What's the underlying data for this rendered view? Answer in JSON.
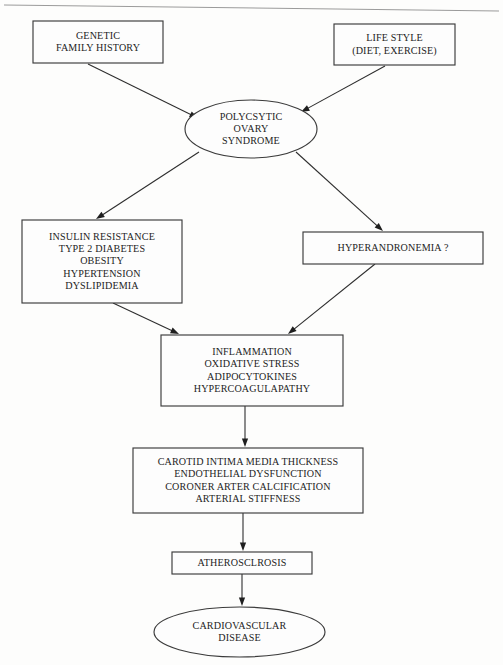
{
  "diagram": {
    "orientation": "top-to-bottom",
    "ink_color": "#232323",
    "line_color": "#2e2e2e",
    "background_color": "#fdfdfc",
    "nodes": [
      {
        "id": "genetic",
        "shape": "rectangle",
        "lines": [
          "GENETIC",
          "FAMILY HISTORY"
        ],
        "x": 33,
        "y": 21,
        "w": 130,
        "h": 42
      },
      {
        "id": "lifestyle",
        "shape": "rectangle",
        "lines": [
          "LIFE STYLE",
          "(DIET, EXERCISE)"
        ],
        "x": 334,
        "y": 24,
        "w": 121,
        "h": 41
      },
      {
        "id": "pcos",
        "shape": "ellipse",
        "lines": [
          "POLYCSYTIC",
          "OVARY",
          "SYNDROME"
        ],
        "x": 185,
        "y": 100,
        "w": 132,
        "h": 58
      },
      {
        "id": "metabolic",
        "shape": "rectangle",
        "lines": [
          "INSULIN RESISTANCE",
          "TYPE 2 DIABETES",
          "OBESITY",
          "HYPERTENSION",
          "DYSLIPIDEMIA"
        ],
        "x": 22,
        "y": 220,
        "w": 160,
        "h": 83
      },
      {
        "id": "hyperandronemia",
        "shape": "rectangle",
        "lines": [
          "HYPERANDRONEMIA ?"
        ],
        "x": 303,
        "y": 232,
        "w": 180,
        "h": 32
      },
      {
        "id": "inflammation",
        "shape": "rectangle",
        "lines": [
          "INFLAMMATION",
          "OXIDATIVE STRESS",
          "ADIPOCYTOKINES",
          "HYPERCOAGULAPATHY"
        ],
        "x": 161,
        "y": 335,
        "w": 182,
        "h": 71
      },
      {
        "id": "vascular",
        "shape": "rectangle",
        "lines": [
          "CAROTID INTIMA MEDIA THICKNESS",
          "ENDOTHELIAL DYSFUNCTION",
          "CORONER ARTER CALCIFICATION",
          "ARTERIAL STIFFNESS"
        ],
        "x": 133,
        "y": 448,
        "w": 230,
        "h": 65
      },
      {
        "id": "atherosclerosis",
        "shape": "rectangle",
        "lines": [
          "ATHEROSCLROSIS"
        ],
        "x": 172,
        "y": 552,
        "w": 140,
        "h": 22
      },
      {
        "id": "cvd",
        "shape": "ellipse",
        "lines": [
          "CARDIOVASCULAR",
          "DISEASE"
        ],
        "x": 154,
        "y": 607,
        "w": 171,
        "h": 50
      }
    ],
    "edges": [
      {
        "id": "genetic-to-pcos",
        "from": "genetic",
        "to": "pcos",
        "x1": 88,
        "y1": 64,
        "x2": 198,
        "y2": 118
      },
      {
        "id": "lifestyle-to-pcos",
        "from": "lifestyle",
        "to": "pcos",
        "x1": 385,
        "y1": 66,
        "x2": 301,
        "y2": 112
      },
      {
        "id": "pcos-to-metabolic",
        "from": "pcos",
        "to": "metabolic",
        "x1": 199,
        "y1": 152,
        "x2": 96,
        "y2": 219
      },
      {
        "id": "pcos-to-hyperandronemia",
        "from": "pcos",
        "to": "hyperandronemia",
        "x1": 296,
        "y1": 152,
        "x2": 383,
        "y2": 231
      },
      {
        "id": "metabolic-to-inflammation",
        "from": "metabolic",
        "to": "inflammation",
        "x1": 113,
        "y1": 303,
        "x2": 179,
        "y2": 334
      },
      {
        "id": "hyperandronemia-to-inflammation",
        "from": "hyperandronemia",
        "to": "inflammation",
        "x1": 375,
        "y1": 264,
        "x2": 288,
        "y2": 334
      },
      {
        "id": "inflammation-to-vascular",
        "from": "inflammation",
        "to": "vascular",
        "x1": 245,
        "y1": 406,
        "x2": 245,
        "y2": 447
      },
      {
        "id": "vascular-to-atherosclerosis",
        "from": "vascular",
        "to": "atherosclerosis",
        "x1": 243,
        "y1": 513,
        "x2": 243,
        "y2": 551
      },
      {
        "id": "atherosclerosis-to-cvd",
        "from": "atherosclerosis",
        "to": "cvd",
        "x1": 242,
        "y1": 574,
        "x2": 242,
        "y2": 606
      }
    ]
  }
}
